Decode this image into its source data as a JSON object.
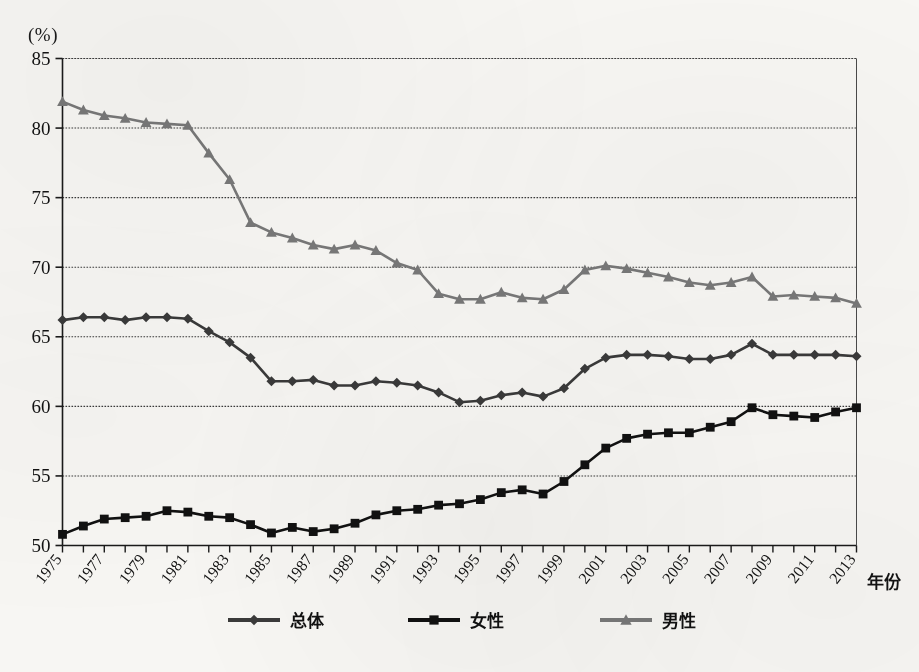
{
  "chart_data": {
    "type": "line",
    "title": "",
    "unit_label": "(%)",
    "xlabel": "年份",
    "ylabel": "",
    "ylim": [
      50,
      85
    ],
    "ytick_step": 5,
    "yticks": [
      50,
      55,
      60,
      65,
      70,
      75,
      80,
      85
    ],
    "grid": true,
    "grid_style": "dotted-horizontal",
    "legend_position": "bottom",
    "x": [
      1975,
      1976,
      1977,
      1978,
      1979,
      1980,
      1981,
      1982,
      1983,
      1984,
      1985,
      1986,
      1987,
      1988,
      1989,
      1990,
      1991,
      1992,
      1993,
      1994,
      1995,
      1996,
      1997,
      1998,
      1999,
      2000,
      2001,
      2002,
      2003,
      2004,
      2005,
      2006,
      2007,
      2008,
      2009,
      2010,
      2011,
      2012,
      2013
    ],
    "xtick_labels": [
      "1975",
      "1977",
      "1979",
      "1981",
      "1983",
      "1985",
      "1987",
      "1989",
      "1991",
      "1993",
      "1995",
      "1997",
      "1999",
      "2001",
      "2003",
      "2005",
      "2007",
      "2009",
      "2011",
      "2013"
    ],
    "xtick_values": [
      1975,
      1977,
      1979,
      1981,
      1983,
      1985,
      1987,
      1989,
      1991,
      1993,
      1995,
      1997,
      1999,
      2001,
      2003,
      2005,
      2007,
      2009,
      2011,
      2013
    ],
    "series": [
      {
        "name": "总体",
        "marker": "diamond",
        "color": "#3a3a3a",
        "values": [
          66.2,
          66.4,
          66.4,
          66.2,
          66.4,
          66.4,
          66.3,
          65.4,
          64.6,
          63.5,
          61.8,
          61.8,
          61.9,
          61.5,
          61.5,
          61.8,
          61.7,
          61.5,
          61.0,
          60.3,
          60.4,
          60.8,
          61.0,
          60.7,
          61.3,
          62.7,
          63.5,
          63.7,
          63.7,
          63.6,
          63.4,
          63.4,
          63.7,
          64.5,
          63.7,
          63.7,
          63.7,
          63.7,
          63.6
        ]
      },
      {
        "name": "女性",
        "marker": "square",
        "color": "#111111",
        "values": [
          50.8,
          51.4,
          51.9,
          52.0,
          52.1,
          52.5,
          52.4,
          52.1,
          52.0,
          51.5,
          50.9,
          51.3,
          51.0,
          51.2,
          51.6,
          52.2,
          52.5,
          52.6,
          52.9,
          53.0,
          53.3,
          53.8,
          54.0,
          53.7,
          54.6,
          55.8,
          57.0,
          57.7,
          58.0,
          58.1,
          58.1,
          58.5,
          58.9,
          59.9,
          59.4,
          59.3,
          59.2,
          59.6,
          59.9
        ]
      },
      {
        "name": "男性",
        "marker": "triangle",
        "color": "#787878",
        "values": [
          81.9,
          81.3,
          80.9,
          80.7,
          80.4,
          80.3,
          80.2,
          78.2,
          76.3,
          73.2,
          72.5,
          72.1,
          71.6,
          71.3,
          71.6,
          71.2,
          70.3,
          69.8,
          68.1,
          67.7,
          67.7,
          68.2,
          67.8,
          67.7,
          68.4,
          69.8,
          70.1,
          69.9,
          69.6,
          69.3,
          68.9,
          68.7,
          68.9,
          69.3,
          67.9,
          68.0,
          67.9,
          67.8,
          67.4
        ]
      }
    ]
  },
  "axis": {
    "unit": "(%)",
    "x_axis_name": "年份"
  },
  "legend": {
    "items": [
      {
        "label": "总体",
        "marker": "diamond",
        "color": "#3a3a3a"
      },
      {
        "label": "女性",
        "marker": "square",
        "color": "#111111"
      },
      {
        "label": "男性",
        "marker": "triangle",
        "color": "#787878"
      }
    ]
  }
}
